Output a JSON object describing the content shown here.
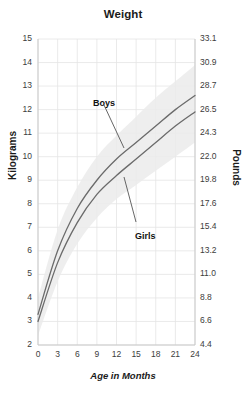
{
  "chart_data": {
    "type": "line",
    "title": "Weight",
    "xlabel": "Age in Months",
    "ylabel": "Kilograms",
    "ylabel_right": "Pounds",
    "xlim": [
      0,
      24
    ],
    "ylim": [
      2,
      15
    ],
    "ylim_right": [
      4.4,
      33.1
    ],
    "grid": true,
    "legend": "inline-annotations",
    "x": [
      0,
      3,
      6,
      9,
      12,
      15,
      18,
      21,
      24
    ],
    "xticks": [
      "0",
      "3",
      "6",
      "9",
      "12",
      "15",
      "18",
      "21",
      "24"
    ],
    "yticks": [
      "15",
      "14",
      "13",
      "12",
      "11",
      "10",
      "9",
      "8",
      "7",
      "6",
      "5",
      "4",
      "3",
      "2"
    ],
    "yticks_right": [
      "33.1",
      "30.9",
      "28.7",
      "26.5",
      "24.3",
      "22.0",
      "19.8",
      "17.6",
      "15.4",
      "13.2",
      "11.0",
      "8.8",
      "6.6",
      "4.4"
    ],
    "series": [
      {
        "name": "Boys",
        "color": "#6b6b6b",
        "values": [
          3.3,
          6.0,
          7.8,
          9.0,
          9.9,
          10.6,
          11.3,
          12.0,
          12.6
        ]
      },
      {
        "name": "Girls",
        "color": "#6b6b6b",
        "values": [
          3.0,
          5.5,
          7.2,
          8.4,
          9.2,
          9.9,
          10.6,
          11.3,
          11.9
        ]
      }
    ],
    "band": {
      "name": "reference-range-shading",
      "color": "#ebebeb",
      "upper": [
        4.0,
        6.9,
        8.7,
        10.0,
        10.9,
        11.7,
        12.5,
        13.2,
        13.9
      ],
      "lower": [
        2.4,
        4.7,
        6.3,
        7.4,
        8.2,
        8.8,
        9.4,
        10.0,
        10.6
      ]
    },
    "annotations": [
      {
        "label": "Boys",
        "x_px": 93,
        "y_px": 98
      },
      {
        "label": "Girls",
        "x_px": 135,
        "y_px": 231
      }
    ]
  },
  "colors": {
    "grid": "#e4e4e4",
    "axis": "#c9c9c9",
    "curve": "#6b6b6b",
    "band": "#ebebeb",
    "text": "#1b1b1b",
    "tick_text": "#3c3c3c",
    "background": "#ffffff"
  }
}
